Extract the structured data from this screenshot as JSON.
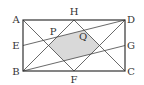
{
  "figure": {
    "type": "geometry",
    "colors": {
      "line": "#444444",
      "shade": "#d9d9d9",
      "text": "#333333"
    },
    "points": {
      "A": {
        "label": "A",
        "x": 23,
        "y": 20,
        "lx": 16,
        "ly": 23
      },
      "B": {
        "label": "B",
        "x": 23,
        "y": 71,
        "lx": 16,
        "ly": 75
      },
      "C": {
        "label": "C",
        "x": 125,
        "y": 71,
        "lx": 131,
        "ly": 75
      },
      "D": {
        "label": "D",
        "x": 125,
        "y": 20,
        "lx": 131,
        "ly": 23
      },
      "E": {
        "label": "E",
        "x": 23,
        "y": 45.5,
        "lx": 16,
        "ly": 49
      },
      "F": {
        "label": "F",
        "x": 74,
        "y": 71,
        "lx": 74,
        "ly": 83
      },
      "G": {
        "label": "G",
        "x": 125,
        "y": 45.5,
        "lx": 131,
        "ly": 49
      },
      "H": {
        "label": "H",
        "x": 74,
        "y": 20,
        "lx": 74,
        "ly": 15
      },
      "P": {
        "label": "P",
        "x": 57,
        "y": 37,
        "lx": 53,
        "ly": 35
      },
      "Q": {
        "label": "Q",
        "x": 84.2,
        "y": 30.2,
        "lx": 83,
        "ly": 40
      }
    },
    "segments": [
      [
        "A",
        "F"
      ],
      [
        "H",
        "B"
      ],
      [
        "H",
        "C"
      ],
      [
        "D",
        "F"
      ],
      [
        "E",
        "D"
      ],
      [
        "B",
        "G"
      ]
    ],
    "shaded_polygon": "48.5,45.5 57,37 84.2,30.2 99.5,45.5 91,54 63.8,60.8"
  }
}
